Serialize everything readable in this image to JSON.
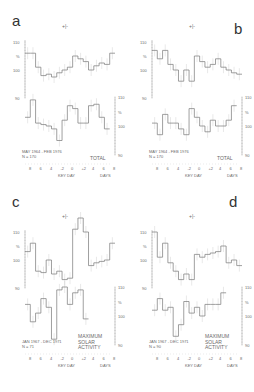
{
  "figure": {
    "panels": [
      "a",
      "b",
      "c",
      "d"
    ]
  },
  "chart_data": [
    {
      "panel": "a",
      "type": "line",
      "title": "TOTAL",
      "period": "MAY 1964 - FEB 1976",
      "n": "N = 170",
      "xlabel": "KEY DAY",
      "xunit": "DAYS",
      "x_ticks": [
        "8",
        "6",
        "4",
        "-2",
        "0",
        "+2",
        "4",
        "6",
        "8"
      ],
      "y_ticks_left": [
        "110",
        "%",
        "100",
        "90"
      ],
      "y_ticks_right": [
        "110",
        "%",
        "100",
        "90"
      ],
      "error_marker": "+|-",
      "series": [
        {
          "name": "upper",
          "values": [
            106,
            106,
            101,
            98,
            98.5,
            97.5,
            99,
            100,
            101,
            105,
            104,
            103,
            100,
            101.5,
            102.5,
            102,
            106
          ]
        },
        {
          "name": "lower",
          "values": [
            103,
            109,
            101,
            100.5,
            100,
            99,
            95,
            102,
            107,
            106,
            101,
            101,
            107,
            107.5,
            103,
            99
          ]
        }
      ]
    },
    {
      "panel": "b",
      "type": "line",
      "title": "TOTAL",
      "period": "MAY 1964 - FEB 1976",
      "n": "N = 170",
      "xlabel": "KEY DAY",
      "xunit": "DAYS",
      "x_ticks": [
        "8",
        "6",
        "4",
        "-2",
        "0",
        "+2",
        "4",
        "6",
        "8"
      ],
      "y_ticks_left": [
        "110",
        "%",
        "100",
        "90"
      ],
      "y_ticks_right": [
        "110",
        "%",
        "100",
        "90"
      ],
      "error_marker": "+|-",
      "series": [
        {
          "name": "upper",
          "values": [
            107,
            104,
            107,
            102,
            100,
            96,
            100,
            96,
            105,
            103,
            101,
            102,
            104,
            101,
            100,
            99,
            98.5
          ]
        },
        {
          "name": "lower",
          "values": [
            101,
            97,
            104,
            101,
            101,
            99,
            97,
            106,
            103,
            100,
            98,
            102,
            100,
            100,
            102,
            107
          ]
        }
      ]
    },
    {
      "panel": "c",
      "type": "line",
      "title": "MAXIMUM SOLAR ACTIVITY",
      "period": "JAN 1967 - DEC 1971",
      "n": "N = 71",
      "xlabel": "KEY DAY",
      "xunit": "DAYS",
      "x_ticks": [
        "8",
        "6",
        "4",
        "-2",
        "0",
        "+2",
        "4",
        "6",
        "8"
      ],
      "y_ticks_left": [
        "110",
        "%",
        "100",
        "90"
      ],
      "y_ticks_right": [
        "110",
        "%",
        "100",
        "90"
      ],
      "error_marker": "+|-",
      "series": [
        {
          "name": "upper",
          "values": [
            103,
            106,
            96,
            95.5,
            100,
            95,
            96,
            93,
            93.5,
            111,
            115,
            110,
            98,
            99,
            99.5,
            100,
            106
          ]
        },
        {
          "name": "lower",
          "values": [
            104,
            98,
            101,
            106,
            103,
            92,
            109,
            110,
            104,
            108,
            109,
            99
          ]
        }
      ]
    },
    {
      "panel": "d",
      "type": "line",
      "title": "MAXIMUM SOLAR ACTIVITY",
      "period": "JAN 1967 - DEC 1971",
      "n": "N = 90",
      "xlabel": "KEY DAY",
      "xunit": "DAYS",
      "x_ticks": [
        "8",
        "6",
        "4",
        "-2",
        "0",
        "+2",
        "4",
        "6",
        "8"
      ],
      "y_ticks_left": [
        "110",
        "%",
        "100",
        "90"
      ],
      "y_ticks_right": [
        "110",
        "%",
        "100",
        "90"
      ],
      "error_marker": "+|-",
      "series": [
        {
          "name": "upper",
          "values": [
            110,
            101,
            106,
            99,
            96,
            93,
            95,
            93,
            102,
            101,
            102,
            102.5,
            103,
            105,
            99,
            100,
            98
          ]
        },
        {
          "name": "lower",
          "values": [
            102,
            106,
            102,
            103,
            93,
            97,
            105,
            101,
            103,
            100,
            104,
            104,
            104,
            108
          ]
        }
      ]
    }
  ],
  "labels": {
    "a": {
      "letter": "a",
      "total": "TOTAL",
      "period": "MAY 1964 - FEB 1976",
      "n": "N = 170",
      "days": "DAYS",
      "keyday": "KEY",
      "keyday2": "DAY"
    },
    "b": {
      "letter": "b",
      "total": "TOTAL",
      "period": "MAY 1964 - FEB 1976",
      "n": "N = 170",
      "days": "DAYS",
      "keyday": "KEY",
      "keyday2": "DAY"
    },
    "c": {
      "letter": "c",
      "line1": "MAXIMUM",
      "line2": "SOLAR",
      "line3": "ACTIVITY",
      "period": "JAN 1967 - DEC 1971",
      "n": "N = 71",
      "days": "DAYS",
      "keyday": "KEY",
      "keyday2": "DAY"
    },
    "d": {
      "letter": "d",
      "line1": "MAXIMUM",
      "line2": "SOLAR",
      "line3": "ACTIVITY",
      "period": "JAN 1967 - DEC 1971",
      "n": "N = 90",
      "days": "DAYS",
      "keyday": "KEY",
      "keyday2": "DAY"
    },
    "ticks": {
      "t0": "8",
      "t1": "6",
      "t2": "4",
      "t3": "-2",
      "t4": "0",
      "t5": "+2",
      "t6": "4",
      "t7": "6",
      "t8": "8"
    },
    "y": {
      "v110": "110",
      "pct": "%",
      "v100": "100",
      "v90": "90"
    },
    "err": {
      "plus": "+",
      "minus": "-",
      "mark_i": "I"
    }
  }
}
